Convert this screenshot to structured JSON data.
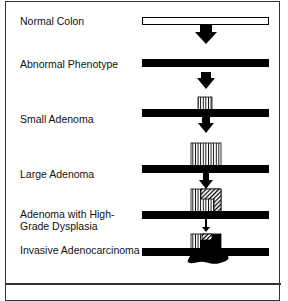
{
  "diagram": {
    "stages": [
      {
        "label": "Normal Colon",
        "bar_fill": "#ffffff"
      },
      {
        "label": "Abnormal Phenotype",
        "bar_fill": "#000000"
      },
      {
        "label": "Small Adenoma",
        "bar_fill": "#000000"
      },
      {
        "label": "Large Adenoma",
        "bar_fill": "#000000"
      },
      {
        "label_line1": "Adenoma with High-",
        "label_line2": "Grade Dysplasia",
        "bar_fill": "#000000"
      },
      {
        "label": "Invasive Adenocarcinoma",
        "bar_fill": "#000000"
      }
    ],
    "colors": {
      "ink": "#000000",
      "border": "#333333",
      "background": "#ffffff"
    }
  }
}
